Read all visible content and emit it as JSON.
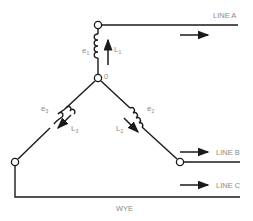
{
  "diagram": {
    "title": "WYE",
    "lines": [
      {
        "id": "line-a",
        "label": "LINE A"
      },
      {
        "id": "line-b",
        "label": "LINE B"
      },
      {
        "id": "line-c",
        "label": "LINE C"
      }
    ],
    "windings": [
      {
        "emf": "e",
        "emf_sub": "1",
        "inductor": "L",
        "inductor_sub": "1"
      },
      {
        "emf": "e",
        "emf_sub": "2",
        "inductor": "L",
        "inductor_sub": "2"
      },
      {
        "emf": "e",
        "emf_sub": "3",
        "inductor": "L",
        "inductor_sub": "3"
      }
    ],
    "neutral_label": "0",
    "colors": {
      "line": "#1a1a1a",
      "text": "#8a8a8a",
      "background": "#ffffff"
    }
  }
}
